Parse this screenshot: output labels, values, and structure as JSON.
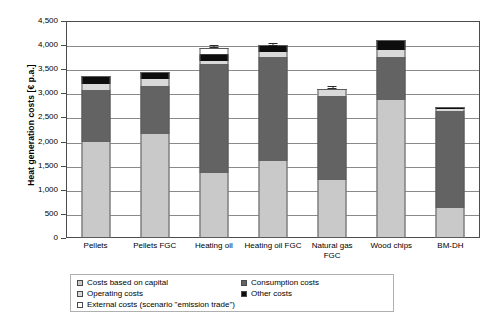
{
  "chart_data": {
    "type": "bar",
    "subtype": "stacked-bar-with-error-bars",
    "title": "",
    "xlabel": "",
    "ylabel": "Heat generation costs [€ p.a.]",
    "ylim": [
      0,
      4500
    ],
    "ytick_step": 500,
    "ytick_labels": [
      "4,500",
      "4,000",
      "3,500",
      "3,000",
      "2,500",
      "2,000",
      "1,500",
      "1,000",
      "500",
      "0"
    ],
    "ytick_values": [
      4500,
      4000,
      3500,
      3000,
      2500,
      2000,
      1500,
      1000,
      500,
      0
    ],
    "grid": true,
    "legend_position": "bottom-left",
    "categories": [
      "Pellets",
      "Pellets FGC",
      "Heating oil",
      "Heating oil FGC",
      "Natural gas FGC",
      "Wood chips",
      "BM-DH"
    ],
    "series": [
      {
        "name": "Costs based on capital",
        "color": "#c9c9c9",
        "values": [
          2000,
          2160,
          1350,
          1590,
          1210,
          2860,
          620
        ]
      },
      {
        "name": "Consumption costs",
        "color": "#636363",
        "values": [
          1060,
          990,
          2250,
          2160,
          1740,
          900,
          2010
        ]
      },
      {
        "name": "Operating costs",
        "color": "#d9d9d9",
        "values": [
          130,
          140,
          80,
          110,
          110,
          130,
          50
        ]
      },
      {
        "name": "Other costs",
        "color": "#0d0d0d",
        "values": [
          180,
          160,
          110,
          140,
          40,
          210,
          40
        ]
      },
      {
        "name": "External costs (scenario \"emission trade\")",
        "color": "#ffffff",
        "values": [
          0,
          0,
          160,
          0,
          0,
          0,
          0
        ]
      }
    ],
    "totals": [
      3370,
      3450,
      3950,
      4000,
      3100,
      4100,
      2720
    ],
    "error_bars": [
      {
        "category": "Heating oil",
        "upper": 4010,
        "lower": 3935
      },
      {
        "category": "Heating oil FGC",
        "upper": 4045,
        "lower": 3985
      },
      {
        "category": "Natural gas FGC",
        "upper": 3150,
        "lower": 3095
      }
    ]
  },
  "axis": {
    "y_title": "Heat generation costs [€ p.a.]"
  },
  "legend": {
    "items": [
      {
        "label": "Costs based on capital",
        "swatch": "sw-capital"
      },
      {
        "label": "Consumption costs",
        "swatch": "sw-consumption"
      },
      {
        "label": "Operating costs",
        "swatch": "sw-operating"
      },
      {
        "label": "Other costs",
        "swatch": "sw-other"
      },
      {
        "label": "External costs (scenario \"emission trade\")",
        "swatch": "sw-external"
      }
    ]
  }
}
